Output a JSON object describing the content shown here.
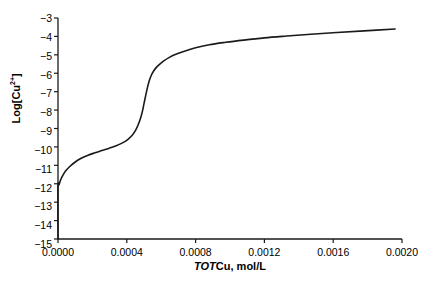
{
  "chart_data": {
    "type": "line",
    "title": "",
    "xlabel_parts": {
      "italic": "TOT",
      "rest": "Cu, mol/L"
    },
    "xlabel": "TOTCu, mol/L",
    "ylabel_parts": {
      "base": "Log[Cu",
      "sup": "2+",
      "close": "]"
    },
    "ylabel": "Log[Cu2+]",
    "xlim": [
      0.0,
      0.002
    ],
    "ylim": [
      -15,
      -3
    ],
    "xticks": [
      0.0,
      0.0004,
      0.0008,
      0.0012,
      0.0016,
      0.002
    ],
    "xtick_labels": [
      "0.0000",
      "0.0004",
      "0.0008",
      "0.0012",
      "0.0016",
      "0.0020"
    ],
    "yticks": [
      -3,
      -4,
      -5,
      -6,
      -7,
      -8,
      -9,
      -10,
      -11,
      -12,
      -13,
      -14,
      -15
    ],
    "ytick_labels": [
      "−3",
      "−4",
      "−5",
      "−6",
      "−7",
      "−8",
      "−9",
      "−10",
      "−11",
      "−12",
      "−13",
      "−14",
      "−15"
    ],
    "grid": false,
    "legend": null,
    "line_color": "#1a1a1a",
    "line_width": 1.6,
    "series": [
      {
        "name": "Log[Cu2+] vs TOTCu",
        "x": [
          0.0,
          0.0,
          6e-06,
          1.5e-05,
          2.8e-05,
          4.5e-05,
          7e-05,
          0.0001,
          0.000135,
          0.000175,
          0.000215,
          0.000255,
          0.000295,
          0.000335,
          0.000375,
          0.000405,
          0.00043,
          0.00045,
          0.000465,
          0.000478,
          0.00049,
          0.0005,
          0.00051,
          0.00052,
          0.00053,
          0.000542,
          0.000556,
          0.000572,
          0.000592,
          0.000615,
          0.000645,
          0.000685,
          0.000735,
          0.0008,
          0.00088,
          0.000975,
          0.00108,
          0.0012,
          0.00133,
          0.00147,
          0.00162,
          0.00178,
          0.00196
        ],
        "y": [
          -15.0,
          -12.2,
          -12.05,
          -11.8,
          -11.55,
          -11.3,
          -11.05,
          -10.82,
          -10.62,
          -10.45,
          -10.32,
          -10.2,
          -10.08,
          -9.95,
          -9.78,
          -9.6,
          -9.38,
          -9.12,
          -8.82,
          -8.5,
          -8.1,
          -7.65,
          -7.2,
          -6.78,
          -6.42,
          -6.12,
          -5.88,
          -5.68,
          -5.5,
          -5.33,
          -5.15,
          -4.97,
          -4.8,
          -4.62,
          -4.45,
          -4.32,
          -4.2,
          -4.08,
          -3.98,
          -3.88,
          -3.79,
          -3.7,
          -3.6
        ]
      }
    ],
    "annotations": []
  },
  "axes": {
    "left_spine": true,
    "bottom_spine": true,
    "top_spine": false,
    "right_spine": false,
    "tick_direction": "out",
    "axis_color": "#1a1a1a"
  }
}
